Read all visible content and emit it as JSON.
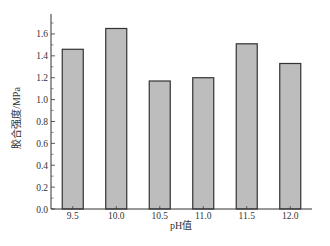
{
  "chart_data": {
    "type": "bar",
    "title": "",
    "xlabel": "pH值",
    "ylabel": "胶合强度/MPa",
    "categories": [
      "9.5",
      "10.0",
      "10.5",
      "11.0",
      "11.5",
      "12.0"
    ],
    "values": [
      1.46,
      1.65,
      1.17,
      1.2,
      1.51,
      1.33
    ],
    "ylim": [
      0,
      1.78
    ],
    "yticks": [
      0.0,
      0.2,
      0.4,
      0.6,
      0.8,
      1.0,
      1.2,
      1.4,
      1.6
    ],
    "ytick_labels": [
      "0.0",
      "0.2",
      "0.4",
      "0.6",
      "0.8",
      "1.0",
      "1.2",
      "1.4",
      "1.6"
    ],
    "grid": false,
    "legend": null,
    "bar_color": "#bdbdbd",
    "bar_edge_color": "#333333"
  }
}
